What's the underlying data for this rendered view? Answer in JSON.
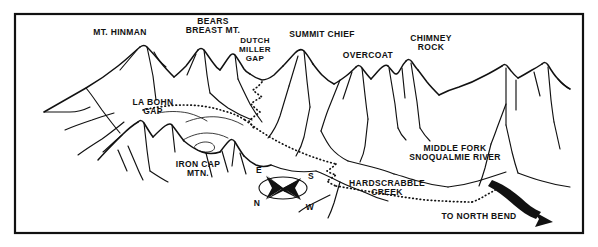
{
  "map": {
    "title": "Panoramic hand-drawn trail map of the Dutch Miller Gap area",
    "frame_color": "#111111",
    "ink_color": "#111111",
    "paper_color": "#ffffff",
    "peak_labels": [
      {
        "id": "mt-hinman",
        "text": "MT. HINMAN",
        "lines": [
          "MT. HINMAN"
        ],
        "x": 120,
        "y": 35
      },
      {
        "id": "bears-breast-mt",
        "text": "BEARS BREAST MT.",
        "lines": [
          "BEARS",
          "BREAST MT."
        ],
        "x": 213,
        "y": 26
      },
      {
        "id": "dutch-miller-gap",
        "text": "DUTCH MILLER GAP",
        "lines": [
          "DUTCH",
          "MILLER",
          "GAP"
        ],
        "x": 255,
        "y": 43
      },
      {
        "id": "summit-chief",
        "text": "SUMMIT CHIEF",
        "lines": [
          "SUMMIT CHIEF"
        ],
        "x": 322,
        "y": 37
      },
      {
        "id": "overcoat",
        "text": "OVERCOAT",
        "lines": [
          "OVERCOAT"
        ],
        "x": 368,
        "y": 58
      },
      {
        "id": "chimney-rock",
        "text": "CHIMNEY ROCK",
        "lines": [
          "CHIMNEY",
          "ROCK"
        ],
        "x": 431,
        "y": 41
      },
      {
        "id": "la-bohn-gap",
        "text": "LA BOHN GAP",
        "lines": [
          "LA BOHN",
          "GAP"
        ],
        "x": 153,
        "y": 105
      },
      {
        "id": "iron-cap-mtn",
        "text": "IRON CAP MTN.",
        "lines": [
          "IRON CAP",
          "MTN."
        ],
        "x": 198,
        "y": 167
      }
    ],
    "feature_labels": [
      {
        "id": "middle-fork-snoqualmie-river",
        "text": "MIDDLE FORK SNOQUALMIE RIVER",
        "lines": [
          "MIDDLE FORK",
          "SNOQUALMIE RIVER"
        ],
        "x": 455,
        "y": 151
      },
      {
        "id": "hardscrabble-creek",
        "text": "HARDSCRABBLE CREEK",
        "lines": [
          "HARDSCRABBLE",
          "CREEK"
        ],
        "x": 387,
        "y": 186
      },
      {
        "id": "to-north-bend",
        "text": "TO NORTH BEND",
        "lines": [
          "TO NORTH BEND"
        ],
        "x": 479,
        "y": 219
      }
    ],
    "compass": {
      "id": "compass-rose",
      "center_x": 282,
      "center_y": 187,
      "points": [
        {
          "label": "E",
          "x": 259,
          "y": 170
        },
        {
          "label": "S",
          "x": 311,
          "y": 176
        },
        {
          "label": "N",
          "x": 257,
          "y": 203
        },
        {
          "label": "W",
          "x": 310,
          "y": 207
        }
      ]
    },
    "legend_note": "Dotted line indicates hiking trail; solid tapered arrow indicates road to North Bend."
  }
}
